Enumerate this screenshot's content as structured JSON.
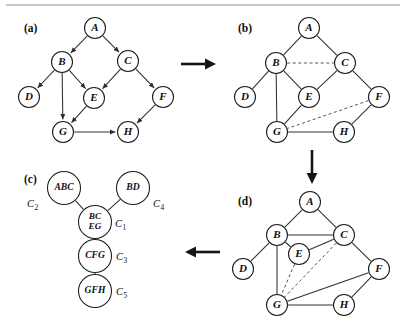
{
  "figure": {
    "width": 406,
    "height": 333,
    "background": "#ffffff",
    "ink_color": "#1b1b1b"
  },
  "panels": {
    "a": {
      "label": "(a)",
      "label_x": 24,
      "label_y": 29,
      "caption": "directed acyclic graph",
      "nodes": [
        {
          "id": "A",
          "label": "A",
          "x": 95,
          "y": 28,
          "r": 10.5
        },
        {
          "id": "B",
          "label": "B",
          "x": 62,
          "y": 62,
          "r": 10.5
        },
        {
          "id": "C",
          "label": "C",
          "x": 128,
          "y": 61,
          "r": 10.5
        },
        {
          "id": "D",
          "label": "D",
          "x": 29,
          "y": 97,
          "r": 10.5
        },
        {
          "id": "E",
          "label": "E",
          "x": 94,
          "y": 98,
          "r": 10.5
        },
        {
          "id": "F",
          "label": "F",
          "x": 163,
          "y": 97,
          "r": 10.5
        },
        {
          "id": "G",
          "label": "G",
          "x": 63,
          "y": 132,
          "r": 10.5
        },
        {
          "id": "H",
          "label": "H",
          "x": 128,
          "y": 132,
          "r": 10.5
        }
      ],
      "edges": [
        {
          "from": "A",
          "to": "B",
          "style": "arrow"
        },
        {
          "from": "A",
          "to": "C",
          "style": "arrow"
        },
        {
          "from": "B",
          "to": "D",
          "style": "arrow"
        },
        {
          "from": "B",
          "to": "E",
          "style": "arrow"
        },
        {
          "from": "B",
          "to": "G",
          "style": "arrow"
        },
        {
          "from": "C",
          "to": "E",
          "style": "arrow"
        },
        {
          "from": "C",
          "to": "F",
          "style": "arrow"
        },
        {
          "from": "E",
          "to": "G",
          "style": "arrow"
        },
        {
          "from": "F",
          "to": "H",
          "style": "arrow"
        },
        {
          "from": "G",
          "to": "H",
          "style": "arrow"
        }
      ]
    },
    "b": {
      "label": "(b)",
      "label_x": 238,
      "label_y": 29,
      "caption": "moralized undirected graph",
      "nodes": [
        {
          "id": "A",
          "label": "A",
          "x": 309,
          "y": 28,
          "r": 10.5
        },
        {
          "id": "B",
          "label": "B",
          "x": 276,
          "y": 63,
          "r": 10.5
        },
        {
          "id": "C",
          "label": "C",
          "x": 345,
          "y": 63,
          "r": 10.5
        },
        {
          "id": "D",
          "label": "D",
          "x": 245,
          "y": 97,
          "r": 10.5
        },
        {
          "id": "E",
          "label": "E",
          "x": 309,
          "y": 97,
          "r": 10.5
        },
        {
          "id": "F",
          "label": "F",
          "x": 379,
          "y": 97,
          "r": 10.5
        },
        {
          "id": "G",
          "label": "G",
          "x": 277,
          "y": 132,
          "r": 10.5
        },
        {
          "id": "H",
          "label": "H",
          "x": 344,
          "y": 132,
          "r": 10.5
        }
      ],
      "edges": [
        {
          "from": "A",
          "to": "B",
          "style": "solid"
        },
        {
          "from": "A",
          "to": "C",
          "style": "solid"
        },
        {
          "from": "B",
          "to": "C",
          "style": "dashed"
        },
        {
          "from": "B",
          "to": "D",
          "style": "solid"
        },
        {
          "from": "B",
          "to": "E",
          "style": "solid"
        },
        {
          "from": "B",
          "to": "G",
          "style": "solid"
        },
        {
          "from": "C",
          "to": "E",
          "style": "solid"
        },
        {
          "from": "C",
          "to": "F",
          "style": "solid"
        },
        {
          "from": "E",
          "to": "G",
          "style": "solid"
        },
        {
          "from": "F",
          "to": "G",
          "style": "dashed"
        },
        {
          "from": "F",
          "to": "H",
          "style": "solid"
        },
        {
          "from": "G",
          "to": "H",
          "style": "solid"
        }
      ]
    },
    "d": {
      "label": "(d)",
      "label_x": 238,
      "label_y": 202,
      "caption": "triangulated graph",
      "nodes": [
        {
          "id": "A",
          "label": "A",
          "x": 310,
          "y": 202,
          "r": 10.5
        },
        {
          "id": "B",
          "label": "B",
          "x": 277,
          "y": 235,
          "r": 10.5
        },
        {
          "id": "C",
          "label": "C",
          "x": 344,
          "y": 235,
          "r": 10.5
        },
        {
          "id": "D",
          "label": "D",
          "x": 243,
          "y": 269,
          "r": 10.5
        },
        {
          "id": "E",
          "label": "E",
          "x": 299,
          "y": 254,
          "r": 10.5
        },
        {
          "id": "F",
          "label": "F",
          "x": 379,
          "y": 269,
          "r": 10.5
        },
        {
          "id": "G",
          "label": "G",
          "x": 277,
          "y": 305,
          "r": 10.5
        },
        {
          "id": "H",
          "label": "H",
          "x": 344,
          "y": 305,
          "r": 10.5
        }
      ],
      "edges": [
        {
          "from": "A",
          "to": "B",
          "style": "solid"
        },
        {
          "from": "A",
          "to": "C",
          "style": "solid"
        },
        {
          "from": "B",
          "to": "C",
          "style": "solid"
        },
        {
          "from": "B",
          "to": "D",
          "style": "solid"
        },
        {
          "from": "B",
          "to": "E",
          "style": "solid"
        },
        {
          "from": "B",
          "to": "G",
          "style": "solid"
        },
        {
          "from": "C",
          "to": "E",
          "style": "solid"
        },
        {
          "from": "C",
          "to": "F",
          "style": "solid"
        },
        {
          "from": "C",
          "to": "G",
          "style": "dashed"
        },
        {
          "from": "E",
          "to": "G",
          "style": "dashed"
        },
        {
          "from": "F",
          "to": "G",
          "style": "solid"
        },
        {
          "from": "F",
          "to": "H",
          "style": "solid"
        },
        {
          "from": "G",
          "to": "H",
          "style": "solid"
        }
      ]
    },
    "c": {
      "label": "(c)",
      "label_x": 24,
      "label_y": 180,
      "caption": "junction tree of cliques",
      "nodes": [
        {
          "id": "ABC",
          "label": "ABC",
          "lines": [
            "ABC"
          ],
          "x": 64,
          "y": 188,
          "r": 16.5,
          "tag": "C",
          "sub": "2",
          "tag_x": 27,
          "tag_y": 205
        },
        {
          "id": "BD",
          "label": "BD",
          "lines": [
            "BD"
          ],
          "x": 133,
          "y": 188,
          "r": 16.5,
          "tag": "C",
          "sub": "4",
          "tag_x": 153,
          "tag_y": 205
        },
        {
          "id": "BCEG",
          "label": "BCEG",
          "lines": [
            "BC",
            "EG"
          ],
          "x": 95,
          "y": 222,
          "r": 16.5,
          "tag": "C",
          "sub": "1",
          "tag_x": 115,
          "tag_y": 225
        },
        {
          "id": "CFG",
          "label": "CFG",
          "lines": [
            "CFG"
          ],
          "x": 95,
          "y": 256,
          "r": 16.5,
          "tag": "C",
          "sub": "3",
          "tag_x": 116,
          "tag_y": 258
        },
        {
          "id": "GFH",
          "label": "GFH",
          "lines": [
            "GFH"
          ],
          "x": 95,
          "y": 291,
          "r": 16.5,
          "tag": "C",
          "sub": "5",
          "tag_x": 116,
          "tag_y": 293
        }
      ],
      "edges": [
        {
          "from": "ABC",
          "to": "BCEG",
          "style": "solid"
        },
        {
          "from": "BD",
          "to": "BCEG",
          "style": "solid"
        },
        {
          "from": "BCEG",
          "to": "CFG",
          "style": "solid"
        },
        {
          "from": "CFG",
          "to": "GFH",
          "style": "solid"
        }
      ]
    }
  },
  "flow_arrows": [
    {
      "id": "a-to-b",
      "direction": "right",
      "x1": 181,
      "y1": 64,
      "x2": 216,
      "y2": 64
    },
    {
      "id": "b-to-d",
      "direction": "down",
      "x1": 312,
      "y1": 150,
      "x2": 312,
      "y2": 184
    },
    {
      "id": "d-to-c",
      "direction": "left",
      "x1": 220,
      "y1": 252,
      "x2": 185,
      "y2": 252
    }
  ],
  "top_rule": {
    "x1": 6,
    "y1": 5,
    "x2": 400,
    "y2": 5,
    "color": "#8d8d8d"
  }
}
